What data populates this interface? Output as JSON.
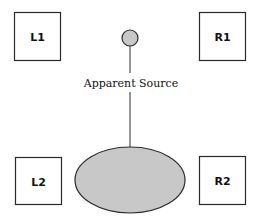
{
  "diagram": {
    "colors": {
      "stroke": "#2a2a2a",
      "fill_gray": "#c8c8c8",
      "background": "#ffffff"
    },
    "speakers": {
      "l1": {
        "label": "L1"
      },
      "r1": {
        "label": "R1"
      },
      "l2": {
        "label": "L2"
      },
      "r2": {
        "label": "R2"
      }
    },
    "apparent_source": {
      "label": "Apparent Source",
      "shape": "small-circle"
    },
    "listener_area": {
      "shape": "ellipse"
    }
  }
}
